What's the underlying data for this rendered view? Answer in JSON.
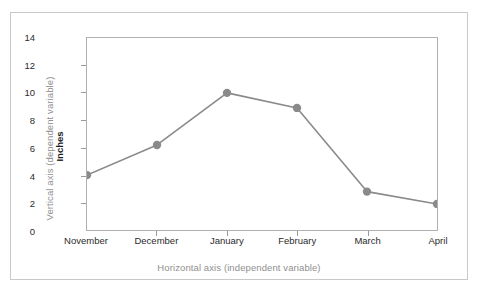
{
  "chart_data": {
    "type": "line",
    "title": "",
    "xlabel": "Horizontal axis (independent variable)",
    "ylabel": "Vertical axis (dependent variable)",
    "y_units_label": "Inches",
    "categories": [
      "November",
      "December",
      "January",
      "February",
      "March",
      "April"
    ],
    "values": [
      4.0,
      6.2,
      10.0,
      8.9,
      2.8,
      1.9
    ],
    "ylim": [
      0,
      14
    ],
    "yticks": [
      0,
      2,
      4,
      6,
      8,
      10,
      12,
      14
    ],
    "ytick_labels": [
      "0",
      "2",
      "4",
      "6",
      "8",
      "10",
      "12",
      "14"
    ],
    "grid": false,
    "legend": false,
    "series": [
      {
        "name": "Inches",
        "values": [
          4.0,
          6.2,
          10.0,
          8.9,
          2.8,
          1.9
        ]
      }
    ],
    "marker": "circle",
    "line_color": "#8a8a8a",
    "marker_color": "#8a8a8a",
    "axis_color": "#b0b0b0",
    "label_color": "#8f8f8f",
    "tick_color": "#2b2b2b"
  }
}
